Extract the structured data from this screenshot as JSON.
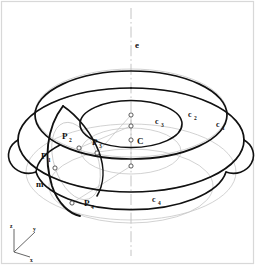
{
  "figure": {
    "background_color": "#ffffff",
    "frame_color": "#d8d8d8",
    "stroke_color": "#111111",
    "hidden_stroke_color": "#c2c2c2",
    "axis_color": "#bbbbbb"
  },
  "labels": {
    "axis_e": "e",
    "center": "C",
    "circle_1": "c",
    "circle_1_sub": "1",
    "circle_2": "c",
    "circle_2_sub": "2",
    "circle_3": "c",
    "circle_3_sub": "3",
    "circle_4": "c",
    "circle_4_sub": "4",
    "point_1": "P",
    "point_1_sub": "1",
    "point_2": "P",
    "point_2_sub": "2",
    "point_3": "P",
    "point_3_sub": "3",
    "point_4": "P",
    "point_4_sub": "4",
    "meridian": "m"
  },
  "coordinate_triad": {
    "z_label": "z",
    "y_label": "y",
    "x_label": "x"
  }
}
